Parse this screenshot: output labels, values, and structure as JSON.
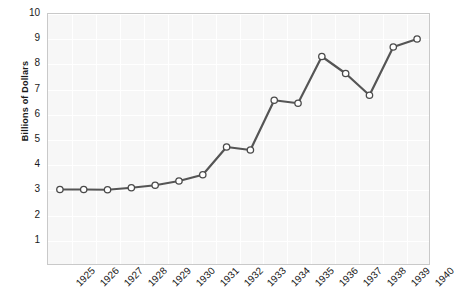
{
  "chart_data": {
    "type": "line",
    "title": "",
    "xlabel": "",
    "ylabel": "Billions of Dollars",
    "categories": [
      "1925",
      "1926",
      "1927",
      "1928",
      "1929",
      "1930",
      "1931",
      "1932",
      "1933",
      "1934",
      "1935",
      "1936",
      "1937",
      "1938",
      "1939",
      "1940"
    ],
    "values": [
      2.98,
      2.98,
      2.97,
      3.05,
      3.15,
      3.32,
      3.57,
      4.68,
      4.56,
      6.55,
      6.43,
      8.3,
      7.62,
      6.75,
      8.68,
      9.0
    ],
    "series": [
      {
        "name": "Billions of Dollars",
        "values": [
          2.98,
          2.98,
          2.97,
          3.05,
          3.15,
          3.32,
          3.57,
          4.68,
          4.56,
          6.55,
          6.43,
          8.3,
          7.62,
          6.75,
          8.68,
          9.0
        ]
      }
    ],
    "ylim": [
      0,
      10
    ],
    "yticks": [
      1,
      2,
      3,
      4,
      5,
      6,
      7,
      8,
      9,
      10
    ],
    "ytick_labels": [
      "1",
      "2",
      "3",
      "4",
      "5",
      "6",
      "7",
      "8",
      "9",
      "10"
    ],
    "xtick_labels": [
      "1925",
      "1926",
      "1927",
      "1928",
      "1929",
      "1930",
      "1931",
      "1932",
      "1933",
      "1934",
      "1935",
      "1936",
      "1937",
      "1938",
      "1939",
      "1940"
    ],
    "grid": true,
    "legend": false,
    "legend_position": "none",
    "line_color": "#555555",
    "marker_fill": "#ffffff",
    "marker_edge": "#4a4a4a",
    "plot_background": "#f7f7f7",
    "gridline_color": "#ffffff",
    "axis_border_color": "#c9c9c9"
  }
}
